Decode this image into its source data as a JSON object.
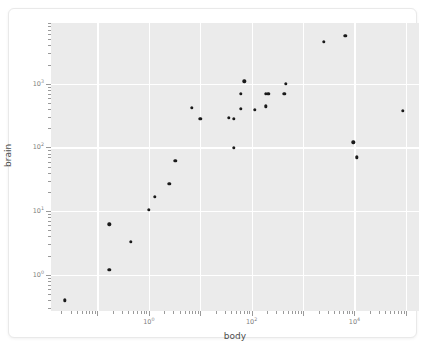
{
  "figure": {
    "background_color": "#ffffff",
    "panel_color": "#ebebeb",
    "gridline_color": "#ffffff",
    "point_color": "#1a1a1a",
    "axis_text_color": "#7f7f7f",
    "title_color": "#4d4d4d"
  },
  "chart_data": {
    "type": "scatter",
    "title": "",
    "xlabel": "body",
    "ylabel": "brain",
    "xscale": "log",
    "yscale": "log",
    "xlim": [
      0.0125,
      180000
    ],
    "ylim": [
      0.27,
      9000
    ],
    "grid": true,
    "legend": null,
    "x_major_ticks": [
      1,
      100,
      10000
    ],
    "x_major_tick_labels": [
      "10",
      "10",
      "10"
    ],
    "x_major_tick_exponents": [
      "0",
      "2",
      "4"
    ],
    "y_major_ticks": [
      1,
      10,
      100,
      1000
    ],
    "y_major_tick_labels": [
      "10",
      "10",
      "10",
      "10"
    ],
    "y_major_tick_exponents": [
      "0",
      "1",
      "2",
      "3"
    ],
    "n_points": 27,
    "x": [
      0.023,
      0.17,
      0.17,
      0.45,
      1.0,
      1.3,
      2.5,
      3.3,
      6.8,
      10.0,
      36.0,
      45.0,
      45.0,
      62.0,
      62.0,
      72.0,
      115.0,
      190.0,
      190.0,
      210.0,
      430.0,
      465.0,
      2550.0,
      6650.0,
      9500.0,
      11000.0,
      87000.0
    ],
    "y": [
      0.4,
      6.2,
      1.2,
      3.3,
      10.5,
      16.6,
      27.0,
      62.0,
      420.0,
      280.0,
      290.0,
      280.0,
      99.0,
      700.0,
      400.0,
      1100.0,
      390.0,
      440.0,
      690.0,
      700.0,
      700.0,
      1000.0,
      4600.0,
      5700.0,
      120.0,
      70.0,
      380.0
    ]
  },
  "axes": {
    "x_title": "body",
    "y_title": "brain"
  }
}
